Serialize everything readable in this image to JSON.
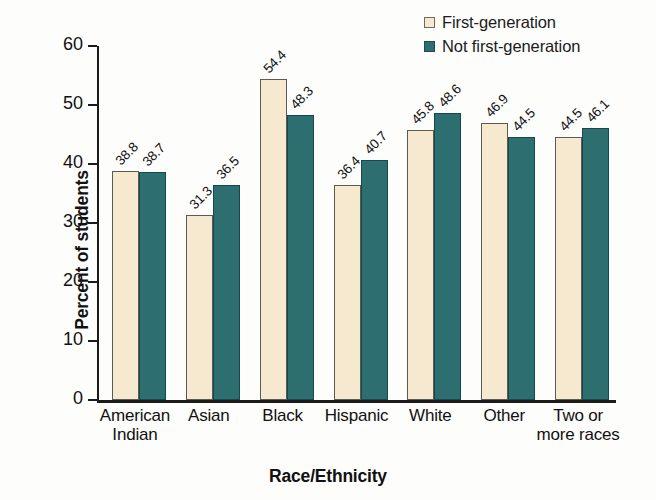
{
  "chart_data": {
    "type": "bar",
    "title": "",
    "xlabel": "Race/Ethnicity",
    "ylabel": "Percent of students",
    "ylim": [
      0,
      60
    ],
    "yticks": [
      0,
      10,
      20,
      30,
      40,
      50,
      60
    ],
    "grid": false,
    "legend_position": "top-right",
    "categories": [
      "American Indian",
      "Asian",
      "Black",
      "Hispanic",
      "White",
      "Other",
      "Two or more races"
    ],
    "category_lines": [
      [
        "American",
        "Indian"
      ],
      [
        "Asian"
      ],
      [
        "Black"
      ],
      [
        "Hispanic"
      ],
      [
        "White"
      ],
      [
        "Other"
      ],
      [
        "Two or",
        "more races"
      ]
    ],
    "series": [
      {
        "name": "First-generation",
        "color": "#f7e9d0",
        "values": [
          38.8,
          31.3,
          54.4,
          36.4,
          45.8,
          46.9,
          44.5
        ]
      },
      {
        "name": "Not first-generation",
        "color": "#2d6e70",
        "values": [
          38.7,
          36.5,
          48.3,
          40.7,
          48.6,
          44.5,
          46.1
        ]
      }
    ],
    "value_labels": [
      [
        "38.8",
        "38.7"
      ],
      [
        "31.3",
        "36.5"
      ],
      [
        "54.4",
        "48.3"
      ],
      [
        "36.4",
        "40.7"
      ],
      [
        "45.8",
        "48.6"
      ],
      [
        "46.9",
        "44.5"
      ],
      [
        "44.5",
        "46.1"
      ]
    ]
  },
  "legend": {
    "items": [
      {
        "label": "First-generation",
        "swatch": "first"
      },
      {
        "label": "Not first-generation",
        "swatch": "notfirst"
      }
    ]
  },
  "axes": {
    "y_title": "Percent of students",
    "x_title": "Race/Ethnicity",
    "y_tick_labels": [
      "0",
      "10",
      "20",
      "30",
      "40",
      "50",
      "60"
    ]
  },
  "colors": {
    "first_generation": "#f7e9d0",
    "not_first_generation": "#2d6e70",
    "axis": "#1b1b1b",
    "background": "#fdfdfb"
  }
}
